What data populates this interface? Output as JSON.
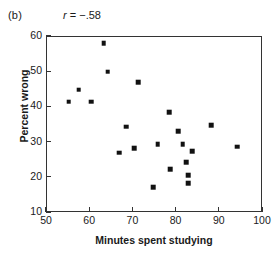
{
  "figure": {
    "panel_label": "(b)",
    "annotation_symbol": "r",
    "annotation_value": " = −.58",
    "annotation_full": "r = −.58"
  },
  "chart_data": {
    "type": "scatter",
    "title": "",
    "xlabel": "Minutes spent studying",
    "ylabel": "Percent wrong",
    "xlim": [
      50,
      100
    ],
    "ylim": [
      10,
      60
    ],
    "xticks": [
      50,
      60,
      70,
      80,
      90,
      100
    ],
    "yticks": [
      10,
      20,
      30,
      40,
      50,
      60
    ],
    "grid": false,
    "legend": null,
    "marker": "square",
    "marker_color": "#111111",
    "correlation": -0.58,
    "n_points": 21,
    "points": [
      {
        "x": 55.3,
        "y": 41.3
      },
      {
        "x": 57.6,
        "y": 44.7
      },
      {
        "x": 60.4,
        "y": 41.3
      },
      {
        "x": 63.4,
        "y": 58.0
      },
      {
        "x": 64.3,
        "y": 49.8
      },
      {
        "x": 66.9,
        "y": 26.8
      },
      {
        "x": 68.5,
        "y": 34.2
      },
      {
        "x": 70.4,
        "y": 28.2
      },
      {
        "x": 71.3,
        "y": 46.9
      },
      {
        "x": 74.8,
        "y": 17.1
      },
      {
        "x": 75.9,
        "y": 29.3
      },
      {
        "x": 78.5,
        "y": 38.4
      },
      {
        "x": 78.7,
        "y": 22.2
      },
      {
        "x": 80.6,
        "y": 33.0
      },
      {
        "x": 81.6,
        "y": 29.3
      },
      {
        "x": 82.5,
        "y": 24.2
      },
      {
        "x": 82.9,
        "y": 20.5
      },
      {
        "x": 82.9,
        "y": 18.2
      },
      {
        "x": 83.8,
        "y": 27.3
      },
      {
        "x": 88.2,
        "y": 34.7
      },
      {
        "x": 94.2,
        "y": 28.5
      }
    ]
  }
}
